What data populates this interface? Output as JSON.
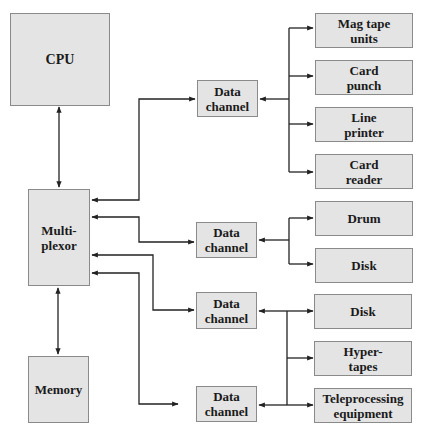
{
  "diagram": {
    "type": "block-diagram",
    "colors": {
      "box_fill": "#e4e4e4",
      "box_border": "#8a8a8a",
      "line": "#222222",
      "text": "#1a1a1a"
    },
    "nodes": {
      "cpu": "CPU",
      "multiplexor": "Multi-\nplexor",
      "memory": "Memory",
      "data_channel_1": "Data\nchannel",
      "data_channel_2": "Data\nchannel",
      "data_channel_3": "Data\nchannel",
      "data_channel_4": "Data\nchannel",
      "mag_tape_units": "Mag tape\nunits",
      "card_punch": "Card\npunch",
      "line_printer": "Line\nprinter",
      "card_reader": "Card\nreader",
      "drum": "Drum",
      "disk_1": "Disk",
      "disk_2": "Disk",
      "hyper_tapes": "Hyper-\ntapes",
      "teleprocessing_equipment": "Teleprocessing\nequipment"
    },
    "edges": [
      {
        "from": "cpu",
        "to": "multiplexor",
        "direction": "both"
      },
      {
        "from": "multiplexor",
        "to": "memory",
        "direction": "both"
      },
      {
        "from": "multiplexor",
        "to": "data_channel_1",
        "direction": "both"
      },
      {
        "from": "multiplexor",
        "to": "data_channel_2",
        "direction": "both"
      },
      {
        "from": "multiplexor",
        "to": "data_channel_3",
        "direction": "both"
      },
      {
        "from": "multiplexor",
        "to": "data_channel_4",
        "direction": "both"
      },
      {
        "from": "data_channel_1",
        "to": "mag_tape_units",
        "direction": "both"
      },
      {
        "from": "data_channel_1",
        "to": "card_punch",
        "direction": "both"
      },
      {
        "from": "data_channel_1",
        "to": "line_printer",
        "direction": "both"
      },
      {
        "from": "data_channel_1",
        "to": "card_reader",
        "direction": "both"
      },
      {
        "from": "data_channel_2",
        "to": "drum",
        "direction": "both"
      },
      {
        "from": "data_channel_2",
        "to": "disk_1",
        "direction": "both"
      },
      {
        "from": "data_channel_3",
        "to": "disk_2",
        "direction": "both"
      },
      {
        "from": "data_channel_3",
        "to": "hyper_tapes",
        "direction": "both"
      },
      {
        "from": "data_channel_3",
        "to": "teleprocessing_equipment",
        "direction": "both"
      },
      {
        "from": "data_channel_4",
        "to": "disk_2",
        "direction": "both"
      },
      {
        "from": "data_channel_4",
        "to": "hyper_tapes",
        "direction": "both"
      },
      {
        "from": "data_channel_4",
        "to": "teleprocessing_equipment",
        "direction": "both"
      }
    ]
  }
}
